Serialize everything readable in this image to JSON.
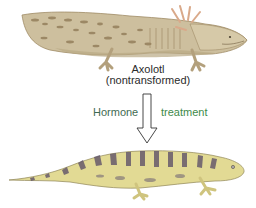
{
  "figure": {
    "top_animal": {
      "name": "Axolotl",
      "subtitle": "(nontransformed)",
      "body_color": "#c9bc9a",
      "pattern_color": "#8a7550"
    },
    "arrow": {
      "left_label": "Hormone",
      "right_label": "treatment",
      "left_label_color": "#3f6b52",
      "right_label_color": "#3e8a4a"
    },
    "bottom_animal": {
      "body_color": "#e3dc95",
      "pattern_color": "#5c5068"
    }
  }
}
